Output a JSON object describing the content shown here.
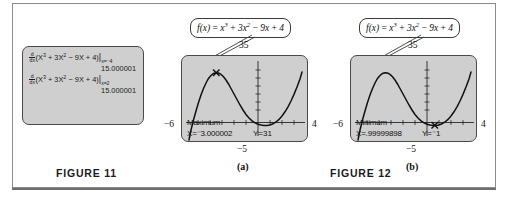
{
  "figure11": {
    "caption": "FIGURE 11",
    "calculator_screen": {
      "line1_expr_pre": "(X",
      "line1": {
        "dd_num": "d",
        "dd_den": "dx",
        "expr": "(X3 + 3X2 − 9X + 4)",
        "eval_at": "x=⁻4",
        "result": "15.000001"
      },
      "line2": {
        "dd_num": "d",
        "dd_den": "dx",
        "expr": "(X3 + 3X2 − 9X + 4)",
        "eval_at": "x=2",
        "result": "15.000001"
      }
    }
  },
  "figure12": {
    "caption": "FIGURE 12",
    "graphs": [
      {
        "id": "a",
        "sublabel": "(a)",
        "callout": "f(x) = x3 + 3x2 − 9x + 4",
        "window": {
          "ymax": "35",
          "xmin": "−6",
          "xmax": "4",
          "ymin": "−5"
        },
        "trace": {
          "label": "Maximum",
          "x_value": "X=⁻3.000002",
          "y_value": "Y=31"
        }
      },
      {
        "id": "b",
        "sublabel": "(b)",
        "callout": "f(x) = x3 + 3x2 − 9x + 4",
        "window": {
          "ymax": "35",
          "xmin": "−6",
          "xmax": "4",
          "ymin": "−5"
        },
        "trace": {
          "label": "Minimum",
          "x_value": "X=.99999898",
          "y_value": "Y=⁻1"
        }
      }
    ]
  },
  "colors": {
    "screen_fill": "#cfcfcf",
    "screen_border": "#4a4a4a",
    "curve": "#111111",
    "frame": "#8b8b8b"
  }
}
